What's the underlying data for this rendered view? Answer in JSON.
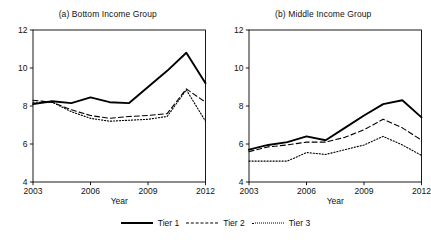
{
  "figure": {
    "background": "#ffffff",
    "axis_color": "#000000"
  },
  "legend": {
    "position": "bottom-center",
    "entries": [
      {
        "label": "Tier 1",
        "style": "solid",
        "name": "legend-item-tier-1"
      },
      {
        "label": "Tier 2",
        "style": "dashed",
        "name": "legend-item-tier-2"
      },
      {
        "label": "Tier 3",
        "style": "dotted",
        "name": "legend-item-tier-3"
      }
    ]
  },
  "chart_data": [
    {
      "type": "line",
      "title": "(a) Bottom Income Group",
      "xlabel": "Year",
      "ylabel": "",
      "x": [
        2003,
        2004,
        2005,
        2006,
        2007,
        2008,
        2009,
        2010,
        2011,
        2012
      ],
      "xlim": [
        2003,
        2012
      ],
      "ylim": [
        4,
        12
      ],
      "xticks": [
        2003,
        2006,
        2009,
        2012
      ],
      "yticks": [
        4,
        6,
        8,
        10,
        12
      ],
      "grid": false,
      "series": [
        {
          "name": "Tier 1",
          "style": "solid",
          "values": [
            8.1,
            8.25,
            8.15,
            8.45,
            8.2,
            8.15,
            9.0,
            9.85,
            10.8,
            9.2
          ]
        },
        {
          "name": "Tier 2",
          "style": "dashed",
          "values": [
            8.3,
            8.2,
            7.8,
            7.5,
            7.35,
            7.45,
            7.5,
            7.6,
            8.9,
            8.2
          ]
        },
        {
          "name": "Tier 3",
          "style": "dotted",
          "values": [
            8.2,
            8.2,
            7.7,
            7.35,
            7.2,
            7.25,
            7.3,
            7.45,
            8.85,
            7.2
          ]
        }
      ]
    },
    {
      "type": "line",
      "title": "(b) Middle Income Group",
      "xlabel": "Year",
      "ylabel": "",
      "x": [
        2003,
        2004,
        2005,
        2006,
        2007,
        2008,
        2009,
        2010,
        2011,
        2012
      ],
      "xlim": [
        2003,
        2012
      ],
      "ylim": [
        4,
        12
      ],
      "xticks": [
        2003,
        2006,
        2009,
        2012
      ],
      "yticks": [
        4,
        6,
        8,
        10,
        12
      ],
      "grid": false,
      "series": [
        {
          "name": "Tier 1",
          "style": "solid",
          "values": [
            5.7,
            5.95,
            6.1,
            6.4,
            6.2,
            6.85,
            7.5,
            8.1,
            8.3,
            7.4
          ]
        },
        {
          "name": "Tier 2",
          "style": "dashed",
          "values": [
            5.6,
            5.85,
            5.95,
            6.1,
            6.1,
            6.35,
            6.75,
            7.3,
            6.85,
            6.2
          ]
        },
        {
          "name": "Tier 3",
          "style": "dotted",
          "values": [
            5.1,
            5.1,
            5.1,
            5.55,
            5.45,
            5.7,
            5.95,
            6.4,
            5.95,
            5.4
          ]
        }
      ]
    }
  ]
}
